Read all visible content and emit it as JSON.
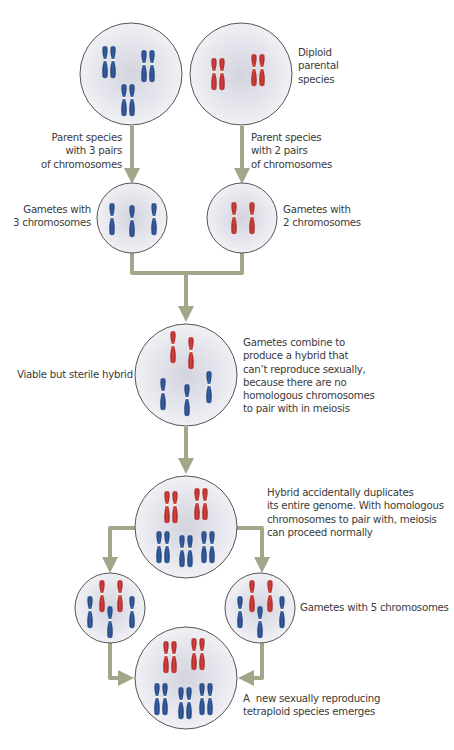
{
  "colors": {
    "parent_a_chromosome": "#2b4f8e",
    "parent_b_chromosome": "#c0312e",
    "arrow": "#a3a78a",
    "cell_fill": "#e6e6ee",
    "cell_border": "#555555",
    "text": "#3b3b3b"
  },
  "cells": [
    {
      "id": "parent-a",
      "cx": 131,
      "cy": 74,
      "r": 51,
      "blue": 6,
      "red": 0
    },
    {
      "id": "parent-b",
      "cx": 241,
      "cy": 74,
      "r": 51,
      "blue": 0,
      "red": 4
    },
    {
      "id": "gamete-a",
      "cx": 132,
      "cy": 218,
      "r": 35,
      "blue": 3,
      "red": 0
    },
    {
      "id": "gamete-b",
      "cx": 242,
      "cy": 218,
      "r": 35,
      "blue": 0,
      "red": 2
    },
    {
      "id": "sterile-hybrid",
      "cx": 186,
      "cy": 375,
      "r": 51,
      "blue": 3,
      "red": 2
    },
    {
      "id": "duplicated-hybrid",
      "cx": 186,
      "cy": 527,
      "r": 51,
      "blue": 6,
      "red": 4
    },
    {
      "id": "gamete-left",
      "cx": 110,
      "cy": 608,
      "r": 35,
      "blue": 3,
      "red": 2
    },
    {
      "id": "gamete-right",
      "cx": 260,
      "cy": 608,
      "r": 35,
      "blue": 3,
      "red": 2
    },
    {
      "id": "tetraploid",
      "cx": 186,
      "cy": 678,
      "r": 51,
      "blue": 6,
      "red": 4
    }
  ],
  "labels": {
    "diploid_parental": [
      "Diploid",
      "parental",
      "species"
    ],
    "parent_a": [
      "Parent species",
      "with 3 pairs",
      "of chromosomes"
    ],
    "parent_b": [
      "Parent species",
      "with 2 pairs",
      "of chromosomes"
    ],
    "gametes_a": [
      "Gametes with",
      "3 chromosomes"
    ],
    "gametes_b": [
      "Gametes with",
      "2 chromosomes"
    ],
    "sterile_hybrid": "Viable but sterile hybrid",
    "gametes_combine": [
      "Gametes combine to",
      "produce a hybrid that",
      "can’t reproduce sexually,",
      "because there are no",
      "homologous chromosomes",
      "to pair with in meiosis"
    ],
    "duplicates": [
      "Hybrid accidentally duplicates",
      "its entire genome. With homologous",
      "chromosomes to pair with, meiosis",
      "can proceed normally"
    ],
    "gametes_5": "Gametes with 5 chromosomes",
    "new_species": [
      "A  new sexually reproducing",
      "tetraploid species emerges"
    ]
  }
}
